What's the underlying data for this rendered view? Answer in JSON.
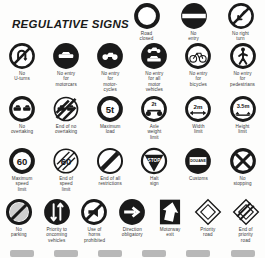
{
  "header": {
    "title": "REGULATIVE SIGNS"
  },
  "rows": [
    {
      "id": "row-1",
      "signs": [
        {
          "name": "road-closed",
          "label": "Road\nclosed",
          "shape": "ring-empty",
          "value": ""
        },
        {
          "name": "no-entry",
          "label": "No\nentry",
          "shape": "disc-bar",
          "value": ""
        },
        {
          "name": "no-right-turn",
          "label": "No right\nturn",
          "shape": "ring-slash-arrow",
          "value": ""
        }
      ]
    },
    {
      "id": "row-2",
      "signs": [
        {
          "name": "no-u-turns",
          "label": "No\nU-turns",
          "shape": "ring-slash-uturn",
          "value": ""
        },
        {
          "name": "no-entry-motorcars",
          "label": "No entry\nfor\nmotorcars",
          "shape": "disc-car",
          "value": ""
        },
        {
          "name": "no-entry-motorcycles",
          "label": "No entry\nfor\nmotor-\ncycles",
          "shape": "disc-motorcycle",
          "value": ""
        },
        {
          "name": "no-entry-all-motor",
          "label": "No entry\nfor all\nmotor\nvehicles",
          "shape": "disc-car-moto",
          "value": ""
        },
        {
          "name": "no-entry-bicycles",
          "label": "No entry\nfor\nbicycles",
          "shape": "ring-bicycle",
          "value": ""
        },
        {
          "name": "no-entry-pedestrians",
          "label": "No entry\nfor\npedestrians",
          "shape": "ring-pedestrian",
          "value": ""
        }
      ]
    },
    {
      "id": "row-3",
      "signs": [
        {
          "name": "no-overtaking",
          "label": "No\novertaking",
          "shape": "ring-two-cars",
          "value": ""
        },
        {
          "name": "end-of-no-overtaking",
          "label": "End of no\novertaking",
          "shape": "ring-two-cars-struck",
          "value": ""
        },
        {
          "name": "maximum-load",
          "label": "Maximum\nload",
          "shape": "ring-value",
          "value": "5t"
        },
        {
          "name": "axle-weight-limit",
          "label": "Axle\nweight\nlimit",
          "shape": "ring-axle",
          "value": "2t"
        },
        {
          "name": "width-limit",
          "label": "Width\nlimit",
          "shape": "ring-width",
          "value": "2m"
        },
        {
          "name": "height-limit",
          "label": "Height\nlimit",
          "shape": "ring-height",
          "value": "3.5m"
        }
      ]
    },
    {
      "id": "row-4",
      "signs": [
        {
          "name": "maximum-speed-limit",
          "label": "Maximum\nspeed\nlimit",
          "shape": "ring-value",
          "value": "60"
        },
        {
          "name": "end-of-speed-limit",
          "label": "End of\nspeed\nlimit",
          "shape": "ring-value-struck",
          "value": "60"
        },
        {
          "name": "end-of-all-restrictions",
          "label": "End of all\nrestrictions",
          "shape": "ring-diagonal",
          "value": ""
        },
        {
          "name": "halt-sign",
          "label": "Halt\nsign",
          "shape": "halt-triangle",
          "value": "STOP"
        },
        {
          "name": "customs",
          "label": "Customs",
          "shape": "disc-customs",
          "value": "DOUANE"
        },
        {
          "name": "no-stopping",
          "label": "No\nstopping",
          "shape": "ring-cross",
          "value": ""
        }
      ]
    },
    {
      "id": "row-5",
      "signs": [
        {
          "name": "no-parking",
          "label": "No\nparking",
          "shape": "ring-slash-solid",
          "value": ""
        },
        {
          "name": "priority-to-oncoming",
          "label": "Priority to\noncoming\nvehicles",
          "shape": "disc-arrows",
          "value": ""
        },
        {
          "name": "use-of-horns-prohibited",
          "label": "Use of\nhorns\nprohibited",
          "shape": "ring-horn-slash",
          "value": ""
        },
        {
          "name": "direction-obligatory",
          "label": "Direction\nobligatory",
          "shape": "disc-arrow-right",
          "value": ""
        },
        {
          "name": "motorway-exit",
          "label": "Motorway\nexit",
          "shape": "rect-arrow-up",
          "value": ""
        },
        {
          "name": "priority-road",
          "label": "Priority\nroad",
          "shape": "diamond-open",
          "value": ""
        },
        {
          "name": "end-of-priority-road",
          "label": "End of\npriority\nroad",
          "shape": "diamond-struck",
          "value": ""
        }
      ]
    }
  ],
  "colors": {
    "ink": "#1a1a1a",
    "caption": "#3a3a3a",
    "paper": "#fdfdfc"
  }
}
